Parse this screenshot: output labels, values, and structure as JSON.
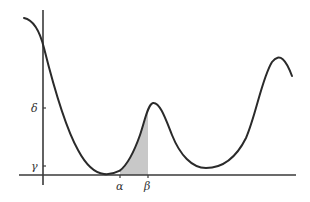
{
  "diagram": {
    "type": "function-graph",
    "labels": {
      "y_upper": "δ",
      "y_lower": "γ",
      "x_left": "α",
      "x_right": "β"
    },
    "colors": {
      "curve": "#2a2a2a",
      "axis": "#3a3a3a",
      "shade": "#c8c8c8",
      "background": "#ffffff"
    }
  }
}
